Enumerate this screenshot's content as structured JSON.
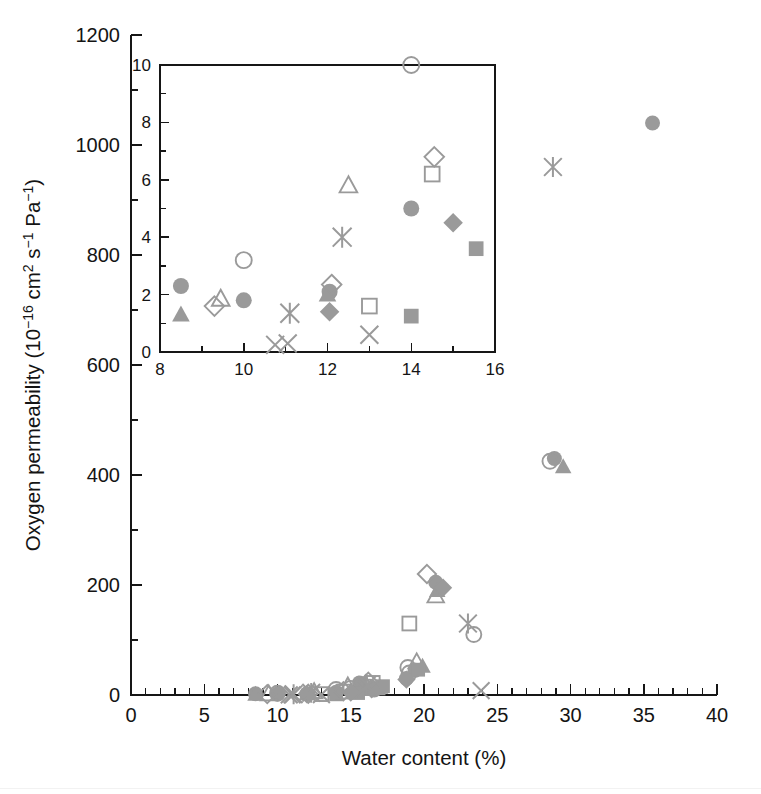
{
  "figure": {
    "title": "",
    "background_color": "#ffffff",
    "marker_color": "#9a9a9a",
    "axis_color": "#161616"
  },
  "main_axes": {
    "xlabel": "Water content (%)",
    "ylabel": "Oxygen permeability (10−16 cm2 s−1 Pa−1)",
    "ylabel_parts": {
      "lead": "Oxygen permeability (10",
      "exp1": "−16",
      "mid1": " cm",
      "exp2": "2",
      "mid2": " s",
      "exp3": "−1",
      "mid3": " Pa",
      "exp4": "−1",
      "tail": ")"
    },
    "xticks": [
      "0",
      "5",
      "10",
      "15",
      "20",
      "25",
      "30",
      "35",
      "40"
    ],
    "yticks": [
      "0",
      "200",
      "400",
      "600",
      "800",
      "1000",
      "1200"
    ],
    "xlim": [
      0,
      40
    ],
    "ylim": [
      0,
      1200
    ],
    "x_minor_per_major": 5,
    "y_minor_per_major": 2,
    "grid": false,
    "legend": "none"
  },
  "inset_axes": {
    "xticks": [
      "8",
      "10",
      "12",
      "14",
      "16"
    ],
    "yticks": [
      "0",
      "2",
      "4",
      "6",
      "8",
      "10"
    ],
    "xlim": [
      8,
      16
    ],
    "ylim": [
      0,
      10
    ],
    "x_minor_per_major": 2,
    "y_minor_per_major": 2,
    "grid": false,
    "legend": "none"
  },
  "chart_data": {
    "type": "scatter",
    "title": "",
    "xlabel": "Water content (%)",
    "ylabel": "Oxygen permeability (10^-16 cm^2 s^-1 Pa^-1)",
    "xlim": [
      0,
      40
    ],
    "ylim": [
      0,
      1200
    ],
    "grid": false,
    "legend": "none",
    "marker_types": [
      "filled-circle",
      "open-circle",
      "filled-triangle",
      "open-triangle",
      "filled-square",
      "open-square",
      "filled-diamond",
      "open-diamond",
      "cross-x",
      "asterisk"
    ],
    "series": [
      {
        "name": "filled-circle",
        "marker": "filled-circle",
        "points": [
          [
            8.5,
            2.3
          ],
          [
            10.0,
            1.8
          ],
          [
            12.0,
            2.1
          ],
          [
            14.0,
            5.0
          ],
          [
            15.6,
            22
          ],
          [
            16.6,
            9
          ],
          [
            18.8,
            30
          ],
          [
            19.4,
            45
          ],
          [
            20.8,
            205
          ],
          [
            28.9,
            430
          ],
          [
            35.6,
            1040
          ]
        ]
      },
      {
        "name": "open-circle",
        "marker": "open-circle",
        "points": [
          [
            10.0,
            3.2
          ],
          [
            14.0,
            10.0
          ],
          [
            15.0,
            12
          ],
          [
            16.3,
            14
          ],
          [
            18.9,
            50
          ],
          [
            19.0,
            40
          ],
          [
            23.4,
            110
          ],
          [
            28.6,
            425
          ]
        ]
      },
      {
        "name": "filled-triangle",
        "marker": "filled-triangle",
        "points": [
          [
            8.5,
            1.3
          ],
          [
            12.0,
            2.0
          ],
          [
            16.4,
            10
          ],
          [
            17.0,
            14
          ],
          [
            19.9,
            52
          ],
          [
            20.9,
            190
          ],
          [
            29.5,
            415
          ]
        ]
      },
      {
        "name": "open-triangle",
        "marker": "open-triangle",
        "points": [
          [
            9.4,
            1.85
          ],
          [
            12.5,
            5.8
          ],
          [
            14.8,
            16
          ],
          [
            16.0,
            20
          ],
          [
            19.5,
            60
          ],
          [
            20.8,
            180
          ]
        ]
      },
      {
        "name": "filled-square",
        "marker": "filled-square",
        "points": [
          [
            14.0,
            1.25
          ],
          [
            15.5,
            3.6
          ],
          [
            16.9,
            12
          ],
          [
            17.2,
            16
          ],
          [
            19.6,
            46
          ]
        ]
      },
      {
        "name": "open-square",
        "marker": "open-square",
        "points": [
          [
            13.0,
            1.6
          ],
          [
            14.5,
            6.2
          ],
          [
            16.5,
            22
          ],
          [
            19.0,
            130
          ]
        ]
      },
      {
        "name": "filled-diamond",
        "marker": "filled-diamond",
        "points": [
          [
            12.0,
            1.4
          ],
          [
            15.0,
            4.5
          ],
          [
            16.4,
            12
          ],
          [
            18.8,
            28
          ],
          [
            21.3,
            195
          ]
        ]
      },
      {
        "name": "open-diamond",
        "marker": "open-diamond",
        "points": [
          [
            9.3,
            1.6
          ],
          [
            12.1,
            2.35
          ],
          [
            14.5,
            6.8
          ],
          [
            16.2,
            24
          ],
          [
            20.2,
            220
          ]
        ]
      },
      {
        "name": "cross-x",
        "marker": "cross-x",
        "points": [
          [
            10.8,
            0.25
          ],
          [
            11.0,
            0.3
          ],
          [
            13.0,
            0.6
          ],
          [
            15.9,
            10
          ],
          [
            23.9,
            8
          ]
        ]
      },
      {
        "name": "asterisk",
        "marker": "asterisk",
        "points": [
          [
            11.1,
            1.35
          ],
          [
            12.3,
            4
          ],
          [
            16.1,
            18
          ],
          [
            23.0,
            130
          ],
          [
            28.8,
            960
          ]
        ]
      }
    ],
    "inset": {
      "type": "scatter",
      "xlim": [
        8,
        16
      ],
      "ylim": [
        0,
        10
      ],
      "xlabel": "",
      "ylabel": "",
      "description": "Magnified view of low water-content region",
      "series": [
        {
          "name": "filled-circle",
          "marker": "filled-circle",
          "points": [
            [
              8.5,
              2.3
            ],
            [
              10.0,
              1.8
            ],
            [
              12.05,
              2.1
            ],
            [
              14.0,
              5.0
            ]
          ]
        },
        {
          "name": "open-circle",
          "marker": "open-circle",
          "points": [
            [
              10.0,
              3.2
            ],
            [
              14.0,
              10.0
            ]
          ]
        },
        {
          "name": "filled-triangle",
          "marker": "filled-triangle",
          "points": [
            [
              8.5,
              1.3
            ],
            [
              12.0,
              2.0
            ]
          ]
        },
        {
          "name": "open-triangle",
          "marker": "open-triangle",
          "points": [
            [
              9.45,
              1.85
            ],
            [
              12.5,
              5.8
            ]
          ]
        },
        {
          "name": "filled-square",
          "marker": "filled-square",
          "points": [
            [
              14.0,
              1.25
            ],
            [
              15.55,
              3.6
            ]
          ]
        },
        {
          "name": "open-square",
          "marker": "open-square",
          "points": [
            [
              13.0,
              1.6
            ],
            [
              14.5,
              6.2
            ]
          ]
        },
        {
          "name": "filled-diamond",
          "marker": "filled-diamond",
          "points": [
            [
              12.05,
              1.4
            ],
            [
              15.0,
              4.5
            ]
          ]
        },
        {
          "name": "open-diamond",
          "marker": "open-diamond",
          "points": [
            [
              9.3,
              1.6
            ],
            [
              12.1,
              2.35
            ],
            [
              14.55,
              6.8
            ]
          ]
        },
        {
          "name": "cross-x",
          "marker": "cross-x",
          "points": [
            [
              10.75,
              0.25
            ],
            [
              11.05,
              0.3
            ],
            [
              13.0,
              0.6
            ]
          ]
        },
        {
          "name": "asterisk",
          "marker": "asterisk",
          "points": [
            [
              11.1,
              1.35
            ],
            [
              12.35,
              4.0
            ]
          ]
        }
      ]
    }
  }
}
